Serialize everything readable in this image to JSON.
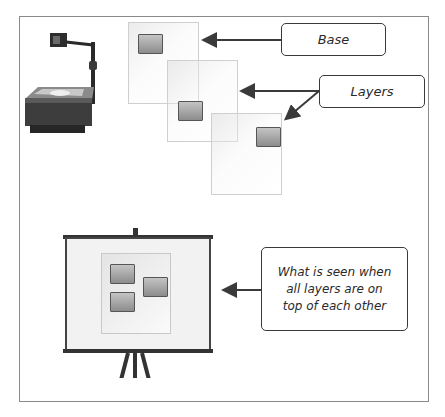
{
  "diagram": {
    "callouts": {
      "base": {
        "label": "Base"
      },
      "layers": {
        "label": "Layers"
      },
      "composite": {
        "label": "What is seen when all layers are on top of each other"
      }
    },
    "icons": {
      "projector": "overhead-projector-icon",
      "screen": "projection-screen-icon"
    },
    "colors": {
      "frame_border": "#8a8a8a",
      "arrow": "#3a3a3a",
      "chip_fill": "#a8a8a8",
      "layer_border": "#cfcfcf"
    }
  }
}
